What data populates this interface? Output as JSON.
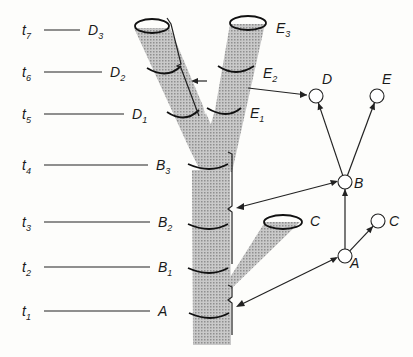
{
  "diagram": {
    "type": "branching-lineage-with-phylogeny",
    "time_labels": [
      {
        "t": "t",
        "sub": "7",
        "y": 30,
        "stage": "D",
        "stage_sub": "3",
        "line_end": 80
      },
      {
        "t": "t",
        "sub": "6",
        "y": 72,
        "stage": "D",
        "stage_sub": "2",
        "line_end": 102
      },
      {
        "t": "t",
        "sub": "5",
        "y": 114,
        "stage": "D",
        "stage_sub": "1",
        "line_end": 124
      },
      {
        "t": "t",
        "sub": "4",
        "y": 165,
        "stage": "B",
        "stage_sub": "3",
        "line_end": 148
      },
      {
        "t": "t",
        "sub": "3",
        "y": 222,
        "stage": "B",
        "stage_sub": "2",
        "line_end": 150
      },
      {
        "t": "t",
        "sub": "2",
        "y": 267,
        "stage": "B",
        "stage_sub": "1",
        "line_end": 150
      },
      {
        "t": "t",
        "sub": "1",
        "y": 311,
        "stage": "A",
        "stage_sub": "",
        "line_end": 150
      }
    ],
    "branch_labels": [
      {
        "text": "E",
        "sub": "3",
        "x": 276,
        "y": 33
      },
      {
        "text": "E",
        "sub": "2",
        "x": 263,
        "y": 78
      },
      {
        "text": "E",
        "sub": "1",
        "x": 250,
        "y": 118
      },
      {
        "text": "C",
        "sub": "",
        "x": 310,
        "y": 226
      }
    ],
    "tree_nodes": [
      {
        "id": "D",
        "label": "D",
        "x": 316,
        "y": 96,
        "lx": 322,
        "ly": 84
      },
      {
        "id": "E",
        "label": "E",
        "x": 377,
        "y": 96,
        "lx": 382,
        "ly": 84
      },
      {
        "id": "B",
        "label": "B",
        "x": 345,
        "y": 182,
        "lx": 354,
        "ly": 188
      },
      {
        "id": "A",
        "label": "A",
        "x": 345,
        "y": 256,
        "lx": 350,
        "ly": 268
      },
      {
        "id": "C",
        "label": "C",
        "x": 378,
        "y": 221,
        "lx": 389,
        "ly": 226
      }
    ],
    "tree_edges": [
      {
        "from": "B",
        "to": "D"
      },
      {
        "from": "B",
        "to": "E"
      },
      {
        "from": "A",
        "to": "B"
      },
      {
        "from": "A",
        "to": "C"
      }
    ],
    "colors": {
      "shade": "#b9b9b9",
      "ink": "#1a1a1a",
      "background": "#fdfdfb"
    }
  }
}
